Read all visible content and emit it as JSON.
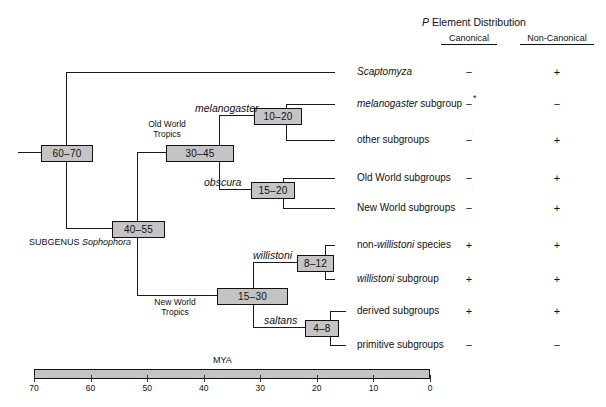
{
  "figure": {
    "type": "phylogenetic-tree",
    "subgenus_label_prefix": "SUBGENUS ",
    "subgenus_label_italic": "Sophophora",
    "geo_labels": [
      {
        "id": "old-world-tropics",
        "line1": "Old World",
        "line2": "Tropics"
      },
      {
        "id": "new-world-tropics",
        "line1": "New World",
        "line2": "Tropics"
      }
    ],
    "clade_labels": [
      {
        "id": "melanogaster",
        "text": "melanogaster"
      },
      {
        "id": "obscura",
        "text": "obscura"
      },
      {
        "id": "willistoni",
        "text": "willistoni"
      },
      {
        "id": "saltans",
        "text": "saltans"
      }
    ],
    "nodes": [
      {
        "id": "root",
        "time": "60–70"
      },
      {
        "id": "sophophora",
        "time": "40–55"
      },
      {
        "id": "old-world",
        "time": "30–45"
      },
      {
        "id": "melanogaster-node",
        "time": "10–20"
      },
      {
        "id": "obscura-node",
        "time": "15–20"
      },
      {
        "id": "new-world",
        "time": "15–30"
      },
      {
        "id": "willistoni-node",
        "time": "8–12"
      },
      {
        "id": "saltans-node",
        "time": "4–8"
      }
    ],
    "taxa": [
      {
        "id": "scaptomyza",
        "pre": "",
        "italic": "Scaptomyza",
        "post": ""
      },
      {
        "id": "melanogaster-subgroup",
        "pre": "",
        "italic": "melanogaster",
        "post": " subgroup"
      },
      {
        "id": "other-subgroups",
        "pre": "other subgroups",
        "italic": "",
        "post": ""
      },
      {
        "id": "old-world-subgroups",
        "pre": "Old World subgroups",
        "italic": "",
        "post": ""
      },
      {
        "id": "new-world-subgroups",
        "pre": "New World subgroups",
        "italic": "",
        "post": ""
      },
      {
        "id": "non-willistoni-species",
        "pre": "non-",
        "italic": "willistoni",
        "post": " species"
      },
      {
        "id": "willistoni-subgroup",
        "pre": "",
        "italic": "willistoni",
        "post": " subgroup"
      },
      {
        "id": "derived-subgroups",
        "pre": "derived subgroups",
        "italic": "",
        "post": ""
      },
      {
        "id": "primitive-subgroups",
        "pre": "primitive subgroups",
        "italic": "",
        "post": ""
      }
    ]
  },
  "distribution": {
    "title_italic": "P",
    "title_rest": " Element Distribution",
    "columns": [
      {
        "id": "canonical",
        "label": "Canonical"
      },
      {
        "id": "non-canonical",
        "label": "Non-Canonical"
      }
    ],
    "rows": [
      {
        "taxon": "scaptomyza",
        "canonical": "−",
        "canonical_note": "",
        "non_canonical": "+"
      },
      {
        "taxon": "melanogaster-subgroup",
        "canonical": "−",
        "canonical_note": "*",
        "non_canonical": "−"
      },
      {
        "taxon": "other-subgroups",
        "canonical": "−",
        "canonical_note": "",
        "non_canonical": "+"
      },
      {
        "taxon": "old-world-subgroups",
        "canonical": "−",
        "canonical_note": "",
        "non_canonical": "+"
      },
      {
        "taxon": "new-world-subgroups",
        "canonical": "−",
        "canonical_note": "",
        "non_canonical": "+"
      },
      {
        "taxon": "non-willistoni-species",
        "canonical": "+",
        "canonical_note": "",
        "non_canonical": "+"
      },
      {
        "taxon": "willistoni-subgroup",
        "canonical": "+",
        "canonical_note": "",
        "non_canonical": "+"
      },
      {
        "taxon": "derived-subgroups",
        "canonical": "+",
        "canonical_note": "",
        "non_canonical": "+"
      },
      {
        "taxon": "primitive-subgroups",
        "canonical": "−",
        "canonical_note": "",
        "non_canonical": "−"
      }
    ]
  },
  "scale": {
    "unit_label": "MYA",
    "ticks": [
      "70",
      "60",
      "50",
      "40",
      "30",
      "20",
      "10",
      "0"
    ],
    "min": 0,
    "max": 70,
    "direction": "descending-left-to-right"
  },
  "colors": {
    "box_fill": "#c4c4c4",
    "line": "#1a1a1a",
    "text": "#111111",
    "background": "#ffffff"
  }
}
